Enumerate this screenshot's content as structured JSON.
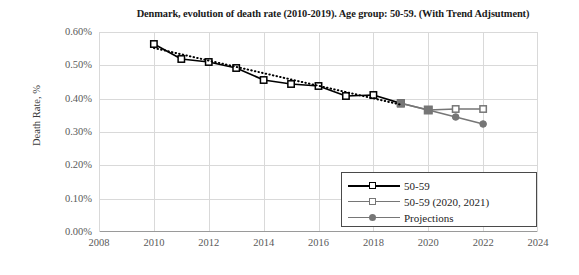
{
  "chart_data": {
    "type": "line",
    "title": "Denmark, evolution of death rate (2010-2019). Age group: 50-59. (With Trend Adjsutment)",
    "xlabel": "",
    "ylabel": "Death Rate, %",
    "xlim": [
      2008,
      2024
    ],
    "ylim": [
      0,
      0.6
    ],
    "ytick_labels": [
      "0.00%",
      "0.10%",
      "0.20%",
      "0.30%",
      "0.40%",
      "0.50%",
      "0.60%"
    ],
    "ytick_values": [
      0.0,
      0.1,
      0.2,
      0.3,
      0.4,
      0.5,
      0.6
    ],
    "xtick_labels": [
      "2008",
      "2010",
      "2012",
      "2014",
      "2016",
      "2018",
      "2020",
      "2022",
      "2024"
    ],
    "xtick_values": [
      2008,
      2010,
      2012,
      2014,
      2016,
      2018,
      2020,
      2022,
      2024
    ],
    "grid": true,
    "legend_position": "lower right",
    "series": [
      {
        "name": "50-59",
        "color": "#000000",
        "marker": "open-square",
        "x": [
          2010,
          2011,
          2012,
          2013,
          2014,
          2015,
          2016,
          2017,
          2018,
          2019
        ],
        "values": [
          0.564,
          0.519,
          0.51,
          0.492,
          0.456,
          0.444,
          0.438,
          0.408,
          0.411,
          0.386
        ]
      },
      {
        "name": "50-59 (2020, 2021)",
        "color": "#767676",
        "marker": "open-square",
        "x": [
          2019,
          2020,
          2021,
          2022
        ],
        "values": [
          0.386,
          0.366,
          0.369,
          0.369
        ]
      },
      {
        "name": "Projections",
        "color": "#767676",
        "marker": "filled-circle",
        "x": [
          2019,
          2020,
          2021,
          2022
        ],
        "values": [
          0.386,
          0.366,
          0.345,
          0.324
        ]
      },
      {
        "name": "Trend",
        "color": "#000000",
        "marker": "none",
        "style": "dotted",
        "x": [
          2010,
          2019
        ],
        "values": [
          0.552,
          0.382
        ]
      }
    ]
  },
  "legend": {
    "entries": [
      {
        "label": "50-59",
        "color": "#000000",
        "marker": "open-square"
      },
      {
        "label": "50-59 (2020, 2021)",
        "color": "#767676",
        "marker": "open-square"
      },
      {
        "label": "Projections",
        "color": "#767676",
        "marker": "filled-circle"
      }
    ]
  },
  "colors": {
    "primary": "#000000",
    "secondary": "#767676",
    "grid": "#d9d9d9",
    "axis": "#9a9a9a",
    "text": "#595959",
    "background": "#ffffff"
  }
}
